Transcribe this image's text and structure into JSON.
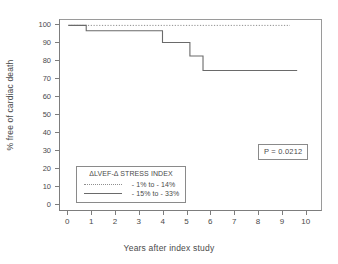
{
  "chart_data": {
    "type": "line",
    "title": "",
    "xlabel": "Years after index study",
    "ylabel": "% free of cardiac death",
    "xlim": [
      -0.35,
      10.6
    ],
    "ylim": [
      -2.5,
      103
    ],
    "xticks": [
      0,
      1,
      2,
      3,
      4,
      5,
      6,
      7,
      8,
      9,
      10
    ],
    "xticklabels": [
      "0",
      "1",
      "2",
      "3",
      "4",
      "5",
      "6",
      "7",
      "8",
      "9",
      "10"
    ],
    "yticks": [
      0,
      10,
      20,
      30,
      40,
      50,
      60,
      70,
      80,
      90,
      100
    ],
    "yticklabels": [
      "0",
      "10",
      "20",
      "30",
      "40",
      "50",
      "60",
      "70",
      "80",
      "90",
      "100"
    ],
    "grid": false,
    "step_style": "post",
    "series": [
      {
        "name": "- 1% to - 14%",
        "style": "dotted",
        "color": "#8f8f8f",
        "x": [
          0.0,
          9.3
        ],
        "y": [
          100.0,
          100.0
        ]
      },
      {
        "name": "- 15% to - 33%",
        "style": "solid",
        "color": "#6a6a6a",
        "x": [
          0.0,
          0.75,
          3.95,
          5.1,
          5.65,
          9.6
        ],
        "y": [
          100.0,
          97.0,
          90.5,
          83.0,
          75.0,
          75.0
        ]
      }
    ],
    "annotations": [
      {
        "name": "p-value",
        "text": "P = 0.0212"
      }
    ]
  },
  "legend": {
    "title": "ΔLVEF-Δ STRESS INDEX",
    "position": "lower-left",
    "items": [
      {
        "label": "- 1% to - 14%",
        "style": "dotted"
      },
      {
        "label": "- 15% to - 33%",
        "style": "solid"
      }
    ]
  },
  "annotation_box": {
    "p_value_label": "P = 0.0212"
  },
  "axes": {
    "y_title": "% free of cardiac death",
    "x_title": "Years after index study"
  }
}
